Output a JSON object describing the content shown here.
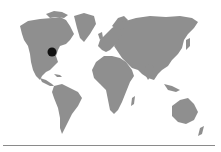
{
  "map": {
    "type": "world-map",
    "land_color": "#8f8f8f",
    "background_color": "#ffffff",
    "marker": {
      "shape": "circle",
      "color": "#111111",
      "region": "North America (Great Lakes / Midwest)",
      "cx": 52,
      "cy": 52,
      "r": 4.5
    }
  },
  "divider": {
    "color": "#8a8a8a"
  }
}
